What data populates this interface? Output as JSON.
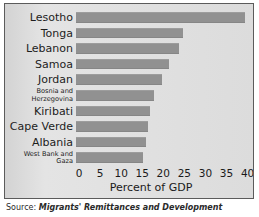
{
  "chart_data": {
    "type": "bar",
    "orientation": "horizontal",
    "title": "",
    "xlabel": "Percent of GDP",
    "ylabel": "",
    "xlim": [
      0,
      42
    ],
    "xticks": [
      0,
      5,
      10,
      15,
      20,
      25,
      30,
      35,
      40
    ],
    "xtick_labels": [
      "0",
      "5",
      "10",
      "15",
      "20",
      "25",
      "30",
      "35",
      "40"
    ],
    "grid": false,
    "legend": false,
    "bar_color": "#919191",
    "plot_background": "#e2e2e2",
    "categories": [
      "Lesotho",
      "Tonga",
      "Lebanon",
      "Samoa",
      "Jordan",
      "Bosnia and Herzegovina",
      "Kiribati",
      "Cape Verde",
      "Albania",
      "West Bank and Gaza"
    ],
    "values": [
      40,
      25.5,
      24.5,
      22,
      20.5,
      18.5,
      17.5,
      17,
      16.5,
      16
    ],
    "bars": [
      {
        "label": "Lesotho",
        "label_lines": [
          "Lesotho"
        ],
        "value": 40,
        "multiline": false
      },
      {
        "label": "Tonga",
        "label_lines": [
          "Tonga"
        ],
        "value": 25.5,
        "multiline": false
      },
      {
        "label": "Lebanon",
        "label_lines": [
          "Lebanon"
        ],
        "value": 24.5,
        "multiline": false
      },
      {
        "label": "Samoa",
        "label_lines": [
          "Samoa"
        ],
        "value": 22,
        "multiline": false
      },
      {
        "label": "Jordan",
        "label_lines": [
          "Jordan"
        ],
        "value": 20.5,
        "multiline": false
      },
      {
        "label": "Bosnia and Herzegovina",
        "label_lines": [
          "Bosnia and",
          "Herzegovina"
        ],
        "value": 18.5,
        "multiline": true
      },
      {
        "label": "Kiribati",
        "label_lines": [
          "Kiribati"
        ],
        "value": 17.5,
        "multiline": false
      },
      {
        "label": "Cape Verde",
        "label_lines": [
          "Cape Verde"
        ],
        "value": 17,
        "multiline": false
      },
      {
        "label": "Albania",
        "label_lines": [
          "Albania"
        ],
        "value": 16.5,
        "multiline": false
      },
      {
        "label": "West Bank and Gaza",
        "label_lines": [
          "West Bank and",
          "Gaza"
        ],
        "value": 16,
        "multiline": true
      }
    ]
  },
  "axis": {
    "x_title": "Percent of GDP",
    "ticks": [
      "0",
      "5",
      "10",
      "15",
      "20",
      "25",
      "30",
      "35",
      "40"
    ]
  },
  "source": {
    "label": "Source:",
    "title": "Migrants' Remittances and Development"
  }
}
